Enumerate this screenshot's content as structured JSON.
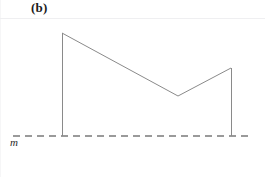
{
  "figure": {
    "panel_label": "(b)",
    "baseline_label": "m",
    "width": 265,
    "height": 177,
    "background_color": "#ffffff"
  },
  "style": {
    "curve_color": "#8a8a8a",
    "curve_width": 1,
    "baseline_color": "#9a9a9a",
    "baseline_width": 1.2,
    "baseline_dash": "7 5",
    "header_rule_color": "#efeff1",
    "label_color": "#1b1b1b"
  },
  "chart_data": {
    "type": "line",
    "title": "(b)",
    "xlabel": "",
    "ylabel": "m",
    "grid": false,
    "legend": "none",
    "xlim": [
      0,
      265
    ],
    "ylim": [
      177,
      0
    ],
    "annotations": [
      {
        "text": "(b)",
        "x": 31,
        "y": 8,
        "role": "panel-label"
      },
      {
        "text": "m",
        "x": 14,
        "y": 143,
        "role": "baseline-label"
      }
    ],
    "series": [
      {
        "name": "profile-outline",
        "closed": false,
        "points": [
          {
            "x": 62,
            "y": 136,
            "role": "left-base"
          },
          {
            "x": 62,
            "y": 33,
            "role": "left-peak"
          },
          {
            "x": 178,
            "y": 96,
            "role": "valley"
          },
          {
            "x": 231,
            "y": 68,
            "role": "right-peak"
          },
          {
            "x": 231,
            "y": 136,
            "role": "right-base"
          }
        ]
      }
    ],
    "reference_lines": [
      {
        "name": "baseline",
        "orientation": "horizontal",
        "y": 136,
        "x_start": 13,
        "x_end": 252,
        "style": "dashed",
        "label": "m"
      }
    ]
  }
}
